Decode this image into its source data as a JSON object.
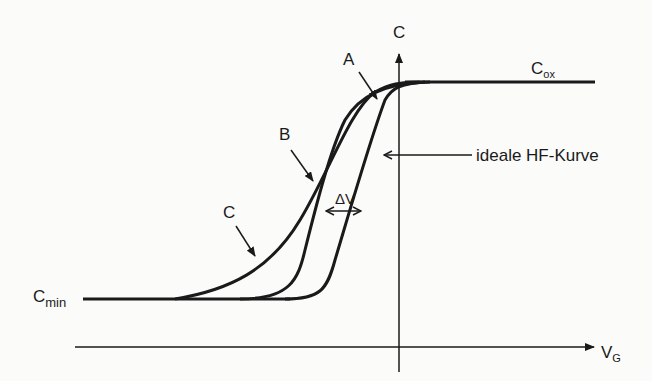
{
  "diagram": {
    "type": "cv-curve",
    "axes": {
      "y_label": "C",
      "x_label_main": "V",
      "x_label_sub": "G"
    },
    "levels": {
      "top": {
        "main": "C",
        "sub": "ox"
      },
      "bottom": {
        "main": "C",
        "sub": "min"
      }
    },
    "curves": [
      {
        "id": "A",
        "label": "A"
      },
      {
        "id": "B",
        "label": "B"
      },
      {
        "id": "C",
        "label": "C"
      }
    ],
    "ideal_curve_label": "ideale HF-Kurve",
    "shift_label": "ΔV",
    "colors": {
      "ink": "#1a1a1a",
      "background": "#fbfbfa"
    }
  }
}
